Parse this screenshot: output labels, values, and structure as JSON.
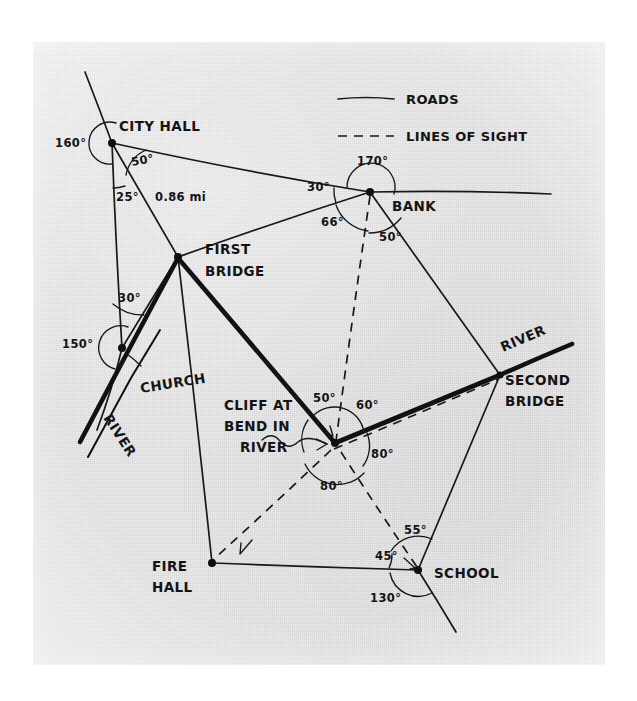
{
  "figure": {
    "kind": "hand-drawn surveying map",
    "legend": {
      "roads_label": "ROADS",
      "sight_label": "LINES OF SIGHT"
    },
    "places": {
      "city_hall": "CITY HALL",
      "bank": "BANK",
      "first_bridge_l1": "FIRST",
      "first_bridge_l2": "BRIDGE",
      "church": "CHURCH",
      "river_west": "RIVER",
      "river_east": "RIVER",
      "second_bridge_l1": "SECOND",
      "second_bridge_l2": "BRIDGE",
      "cliff_l1": "CLIFF AT",
      "cliff_l2": "BEND IN",
      "cliff_l3": "RIVER",
      "fire_hall_l1": "FIRE",
      "fire_hall_l2": "HALL",
      "school": "SCHOOL"
    },
    "distance": {
      "city_hall_to_first_bridge": "0.86 mi"
    },
    "angles": {
      "city_hall_reflex": "160°",
      "city_hall_east": "50°",
      "city_hall_south": "25°",
      "bank_reflex": "170°",
      "bank_west": "30°",
      "bank_sw": "66°",
      "bank_south": "50°",
      "church_north": "30°",
      "church_reflex": "150°",
      "cliff_nw": "50°",
      "cliff_ne": "60°",
      "cliff_east": "80°",
      "cliff_south": "80°",
      "school_ne": "55°",
      "school_west": "45°",
      "school_south": "130°"
    },
    "colors": {
      "paper": "#e3e3e3",
      "ink": "#17181a",
      "background": "#ffffff"
    }
  }
}
